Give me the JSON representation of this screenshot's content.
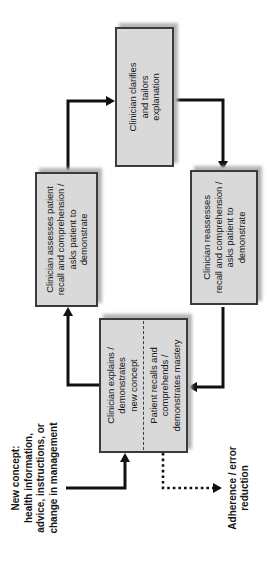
{
  "diagram": {
    "boxes": {
      "explains": {
        "text": "Clinician explains /\ndemonstrates\nnew concept"
      },
      "recalls": {
        "text": "Patient recalls and\ncomprehends /\ndemonstrates mastery"
      },
      "assesses": {
        "text": "Clinician assesses patient\nrecall and comprehension /\nasks patient to\ndemonstrate"
      },
      "clarifies": {
        "text": "Clinician clarifies\nand tailors\nexplanation"
      },
      "reassesses": {
        "text": "Clinician reassesses\nrecall and comprehension /\nasks patient to\ndemonstrate"
      }
    },
    "labels": {
      "input": "New concept:\nhealth information,\nadvice, instructions, or\nchange in management",
      "outcome": "Adherence / error\nreduction"
    },
    "colors": {
      "box_fill": "#d9d9d9",
      "box_border": "#3b3b3b",
      "arrow": "#111111",
      "shadow": "#b5b5b5",
      "background": "#ffffff",
      "text": "#161616"
    }
  }
}
